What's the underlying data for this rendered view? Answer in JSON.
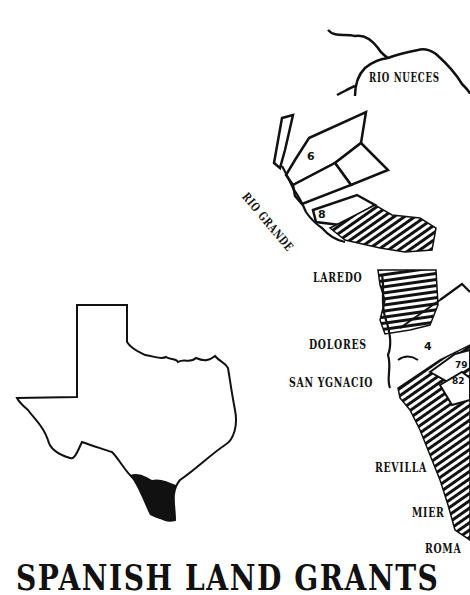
{
  "map": {
    "title": "SPANISH LAND GRANTS",
    "rivers": [
      "RIO NUECES",
      "RIO GRANDE"
    ],
    "towns": [
      {
        "name": "LAREDO"
      },
      {
        "name": "DOLORES"
      },
      {
        "name": "SAN YGNACIO"
      },
      {
        "name": "REVILLA"
      },
      {
        "name": "MIER"
      },
      {
        "name": "ROMA"
      }
    ],
    "parcel_numbers": [
      "6",
      "8",
      "4",
      "79",
      "82"
    ],
    "inset": {
      "label": "Texas outline with South Texas region highlighted"
    },
    "colors": {
      "ink": "#111111",
      "background": "#ffffff"
    }
  }
}
